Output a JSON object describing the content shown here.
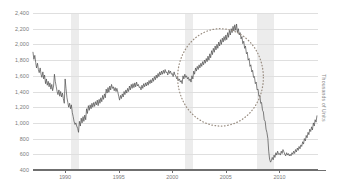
{
  "chart_data": {
    "type": "line",
    "title": "",
    "subtitle": "",
    "xlabel": "",
    "ylabel": "Thousands of Units",
    "ylim": [
      400,
      2400
    ],
    "xlim": [
      1987.0,
      2013.6
    ],
    "grid": true,
    "legend": null,
    "y_ticks": [
      "400",
      "600",
      "800",
      "1,000",
      "1,200",
      "1,400",
      "1,600",
      "1,800",
      "2,000",
      "2,200",
      "2,400"
    ],
    "y_tick_values": [
      400,
      600,
      800,
      1000,
      1200,
      1400,
      1600,
      1800,
      2000,
      2200,
      2400
    ],
    "x_ticks": [
      "1990",
      "1995",
      "2000",
      "2005",
      "2010"
    ],
    "x_tick_values": [
      1990,
      1995,
      2000,
      2005,
      2010
    ],
    "series": [
      {
        "name": "Housing Starts",
        "color": "#4a4a4a",
        "x": [
          1987.0,
          1987.08,
          1987.17,
          1987.25,
          1987.33,
          1987.42,
          1987.5,
          1987.58,
          1987.67,
          1987.75,
          1987.83,
          1987.92,
          1988.0,
          1988.08,
          1988.17,
          1988.25,
          1988.33,
          1988.42,
          1988.5,
          1988.58,
          1988.67,
          1988.75,
          1988.83,
          1988.92,
          1989.0,
          1989.08,
          1989.17,
          1989.25,
          1989.33,
          1989.42,
          1989.5,
          1989.58,
          1989.67,
          1989.75,
          1989.83,
          1989.92,
          1990.0,
          1990.08,
          1990.17,
          1990.25,
          1990.33,
          1990.42,
          1990.5,
          1990.58,
          1990.67,
          1990.75,
          1990.83,
          1990.92,
          1991.0,
          1991.08,
          1991.17,
          1991.25,
          1991.33,
          1991.42,
          1991.5,
          1991.58,
          1991.67,
          1991.75,
          1991.83,
          1991.92,
          1992.0,
          1992.08,
          1992.17,
          1992.25,
          1992.33,
          1992.42,
          1992.5,
          1992.58,
          1992.67,
          1992.75,
          1992.83,
          1992.92,
          1993.0,
          1993.08,
          1993.17,
          1993.25,
          1993.33,
          1993.42,
          1993.5,
          1993.58,
          1993.67,
          1993.75,
          1993.83,
          1993.92,
          1994.0,
          1994.08,
          1994.17,
          1994.25,
          1994.33,
          1994.42,
          1994.5,
          1994.58,
          1994.67,
          1994.75,
          1994.83,
          1994.92,
          1995.0,
          1995.08,
          1995.17,
          1995.25,
          1995.33,
          1995.42,
          1995.5,
          1995.58,
          1995.67,
          1995.75,
          1995.83,
          1995.92,
          1996.0,
          1996.08,
          1996.17,
          1996.25,
          1996.33,
          1996.42,
          1996.5,
          1996.58,
          1996.67,
          1996.75,
          1996.83,
          1996.92,
          1997.0,
          1997.08,
          1997.17,
          1997.25,
          1997.33,
          1997.42,
          1997.5,
          1997.58,
          1997.67,
          1997.75,
          1997.83,
          1997.92,
          1998.0,
          1998.08,
          1998.17,
          1998.25,
          1998.33,
          1998.42,
          1998.5,
          1998.58,
          1998.67,
          1998.75,
          1998.83,
          1998.92,
          1999.0,
          1999.08,
          1999.17,
          1999.25,
          1999.33,
          1999.42,
          1999.5,
          1999.58,
          1999.67,
          1999.75,
          1999.83,
          1999.92,
          2000.0,
          2000.08,
          2000.17,
          2000.25,
          2000.33,
          2000.42,
          2000.5,
          2000.58,
          2000.67,
          2000.75,
          2000.83,
          2000.92,
          2001.0,
          2001.08,
          2001.17,
          2001.25,
          2001.33,
          2001.42,
          2001.5,
          2001.58,
          2001.67,
          2001.75,
          2001.83,
          2001.92,
          2002.0,
          2002.08,
          2002.17,
          2002.25,
          2002.33,
          2002.42,
          2002.5,
          2002.58,
          2002.67,
          2002.75,
          2002.83,
          2002.92,
          2003.0,
          2003.08,
          2003.17,
          2003.25,
          2003.33,
          2003.42,
          2003.5,
          2003.58,
          2003.67,
          2003.75,
          2003.83,
          2003.92,
          2004.0,
          2004.08,
          2004.17,
          2004.25,
          2004.33,
          2004.42,
          2004.5,
          2004.58,
          2004.67,
          2004.75,
          2004.83,
          2004.92,
          2005.0,
          2005.08,
          2005.17,
          2005.25,
          2005.33,
          2005.42,
          2005.5,
          2005.58,
          2005.67,
          2005.75,
          2005.83,
          2005.92,
          2006.0,
          2006.08,
          2006.17,
          2006.25,
          2006.33,
          2006.42,
          2006.5,
          2006.58,
          2006.67,
          2006.75,
          2006.83,
          2006.92,
          2007.0,
          2007.08,
          2007.17,
          2007.25,
          2007.33,
          2007.42,
          2007.5,
          2007.58,
          2007.67,
          2007.75,
          2007.83,
          2007.92,
          2008.0,
          2008.08,
          2008.17,
          2008.25,
          2008.33,
          2008.42,
          2008.5,
          2008.58,
          2008.67,
          2008.75,
          2008.83,
          2008.92,
          2009.0,
          2009.08,
          2009.17,
          2009.25,
          2009.33,
          2009.42,
          2009.5,
          2009.58,
          2009.67,
          2009.75,
          2009.83,
          2009.92,
          2010.0,
          2010.08,
          2010.17,
          2010.25,
          2010.33,
          2010.42,
          2010.5,
          2010.58,
          2010.67,
          2010.75,
          2010.83,
          2010.92,
          2011.0,
          2011.08,
          2011.17,
          2011.25,
          2011.33,
          2011.42,
          2011.5,
          2011.58,
          2011.67,
          2011.75,
          2011.83,
          2011.92,
          2012.0,
          2012.08,
          2012.17,
          2012.25,
          2012.33,
          2012.42,
          2012.5,
          2012.58,
          2012.67,
          2012.75,
          2012.83,
          2012.92,
          2013.0,
          2013.08,
          2013.17,
          2013.25,
          2013.33,
          2013.42,
          2013.5
        ],
        "values": [
          1900,
          1810,
          1860,
          1770,
          1700,
          1760,
          1680,
          1640,
          1700,
          1620,
          1580,
          1650,
          1560,
          1610,
          1500,
          1560,
          1480,
          1530,
          1460,
          1510,
          1430,
          1490,
          1410,
          1470,
          1620,
          1530,
          1460,
          1400,
          1360,
          1420,
          1340,
          1400,
          1330,
          1380,
          1310,
          1250,
          1560,
          1440,
          1320,
          1260,
          1200,
          1250,
          1180,
          1230,
          1130,
          1080,
          1020,
          980,
          1000,
          960,
          930,
          880,
          1020,
          960,
          1060,
          1000,
          1080,
          1020,
          1100,
          1040,
          1180,
          1120,
          1220,
          1160,
          1230,
          1180,
          1250,
          1200,
          1260,
          1210,
          1270,
          1230,
          1290,
          1220,
          1300,
          1250,
          1320,
          1270,
          1350,
          1300,
          1370,
          1320,
          1430,
          1380,
          1450,
          1390,
          1470,
          1420,
          1490,
          1440,
          1460,
          1410,
          1450,
          1400,
          1440,
          1390,
          1340,
          1290,
          1350,
          1310,
          1370,
          1330,
          1400,
          1360,
          1420,
          1380,
          1440,
          1400,
          1470,
          1420,
          1490,
          1440,
          1500,
          1450,
          1510,
          1460,
          1520,
          1470,
          1490,
          1450,
          1460,
          1420,
          1480,
          1440,
          1500,
          1460,
          1510,
          1470,
          1520,
          1480,
          1540,
          1500,
          1550,
          1510,
          1570,
          1530,
          1590,
          1550,
          1610,
          1570,
          1630,
          1590,
          1650,
          1610,
          1660,
          1620,
          1670,
          1630,
          1680,
          1640,
          1650,
          1610,
          1670,
          1630,
          1660,
          1620,
          1630,
          1590,
          1650,
          1610,
          1600,
          1560,
          1580,
          1540,
          1560,
          1520,
          1540,
          1500,
          1600,
          1560,
          1620,
          1580,
          1600,
          1560,
          1580,
          1540,
          1560,
          1520,
          1600,
          1560,
          1660,
          1620,
          1700,
          1660,
          1720,
          1680,
          1740,
          1700,
          1760,
          1720,
          1780,
          1740,
          1800,
          1760,
          1820,
          1780,
          1850,
          1800,
          1880,
          1830,
          1920,
          1870,
          1950,
          1900,
          1980,
          1930,
          2000,
          1950,
          2030,
          1980,
          2060,
          2000,
          2080,
          2030,
          2100,
          2050,
          2120,
          2060,
          2150,
          2090,
          2180,
          2120,
          2200,
          2150,
          2230,
          2170,
          2250,
          2180,
          2260,
          2150,
          2200,
          2120,
          2150,
          2070,
          2100,
          2010,
          2040,
          1950,
          1980,
          1880,
          1900,
          1800,
          1820,
          1720,
          1740,
          1650,
          1670,
          1580,
          1590,
          1500,
          1520,
          1420,
          1430,
          1340,
          1350,
          1250,
          1260,
          1160,
          1140,
          1040,
          1020,
          920,
          880,
          800,
          640,
          540,
          500,
          520,
          560,
          530,
          590,
          560,
          620,
          590,
          640,
          600,
          610,
          590,
          640,
          610,
          660,
          630,
          600,
          580,
          620,
          590,
          610,
          580,
          600,
          580,
          620,
          600,
          640,
          610,
          660,
          630,
          680,
          650,
          700,
          670,
          720,
          700,
          760,
          730,
          800,
          770,
          840,
          810,
          880,
          850,
          920,
          890,
          950,
          910,
          1000,
          960,
          1040,
          1010,
          1090
        ]
      }
    ],
    "shaded_regions": [
      {
        "label": "recession",
        "start": 1990.58,
        "end": 1991.25,
        "color": "#ececec"
      },
      {
        "label": "recession",
        "start": 2001.17,
        "end": 2001.92,
        "color": "#ececec"
      },
      {
        "label": "recession",
        "start": 2007.92,
        "end": 2009.5,
        "color": "#ececec"
      }
    ],
    "annotations": [
      {
        "type": "ellipse",
        "shape": "dotted-circle",
        "color": "#9a8e82",
        "x_center": 2004.5,
        "y_center": 1580,
        "x_radius": 4.0,
        "y_radius": 620
      }
    ]
  },
  "caption": ""
}
